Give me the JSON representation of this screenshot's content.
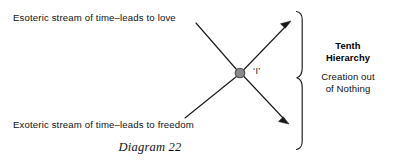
{
  "diagram": {
    "caption": "Diagram 22",
    "labels": {
      "esoteric_stream": "Esoteric stream of time–leads to love",
      "exoteric_stream": "Exoteric stream of time–leads to freedom",
      "center_node": "‘I’",
      "bracket_title": "Tenth\nHierarchy",
      "bracket_title_line1": "Tenth",
      "bracket_title_line2": "Hierarchy",
      "bracket_subtitle_line1": "Creation out",
      "bracket_subtitle_line2": "of Nothing"
    },
    "colors": {
      "stroke": "#1a1a1a",
      "node_fill": "#8a8a8a",
      "node_stroke": "#4a4a4a",
      "background": "#ffffff",
      "text": "#111111"
    },
    "geometry": {
      "node_center_x": 240,
      "node_center_y": 73,
      "node_radius": 5,
      "arrow_up_right_tip_x": 291,
      "arrow_up_right_tip_y": 21,
      "arrow_down_right_tip_x": 289,
      "arrow_down_right_tip_y": 124,
      "line_upper_left_start_x": 196,
      "line_upper_left_start_y": 23,
      "line_lower_left_start_x": 185,
      "line_lower_left_start_y": 118,
      "brace_top_y": 11,
      "brace_bottom_y": 150,
      "brace_mid_y": 78,
      "brace_x": 300
    }
  }
}
